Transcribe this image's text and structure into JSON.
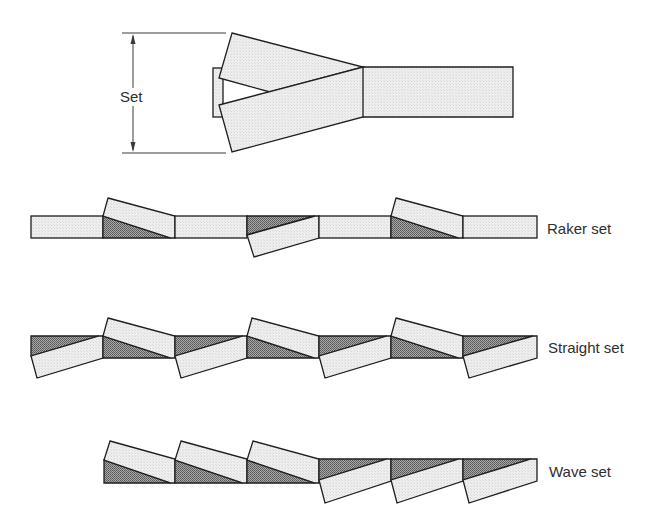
{
  "diagram": {
    "top_figure": {
      "dimension_label": "Set"
    },
    "rows": [
      {
        "id": "raker",
        "label": "Raker set",
        "pattern": [
          "straight",
          "left",
          "straight",
          "right",
          "straight",
          "left",
          "straight"
        ]
      },
      {
        "id": "straight",
        "label": "Straight set",
        "pattern": [
          "right",
          "left",
          "right",
          "left",
          "right",
          "left",
          "right"
        ]
      },
      {
        "id": "wave",
        "label": "Wave set",
        "pattern": [
          "left",
          "left",
          "left",
          "right",
          "right",
          "right"
        ]
      }
    ],
    "colors": {
      "outline": "#1e1e1e",
      "light_fill": "#ececec",
      "dark_fill": "#8a8a8a",
      "text": "#2e2e2e",
      "background": "#ffffff"
    }
  }
}
